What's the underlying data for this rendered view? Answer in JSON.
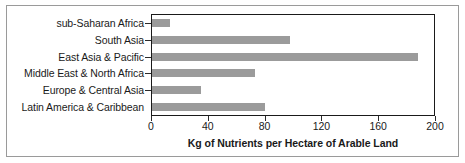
{
  "chart_data": {
    "type": "bar",
    "orientation": "horizontal",
    "title": "",
    "xlabel": "Kg of Nutrients per Hectare of Arable Land",
    "ylabel": "",
    "categories": [
      "sub-Saharan Africa",
      "South Asia",
      "East Asia & Pacific",
      "Middle East & North Africa",
      "Europe & Central Asia",
      "Latin America & Caribbean"
    ],
    "values": [
      13,
      98,
      189,
      73,
      35,
      80
    ],
    "xlim": [
      0,
      200
    ],
    "xticks": [
      0,
      40,
      80,
      120,
      160,
      200
    ],
    "xtick_labels": [
      "0",
      "40",
      "80",
      "120",
      "160",
      "200"
    ],
    "grid": false,
    "legend": false,
    "bar_color": "#9b9b9b",
    "axis_color": "#1a1a1a",
    "frame_color": "#9a9a9a",
    "background": "#ffffff"
  }
}
